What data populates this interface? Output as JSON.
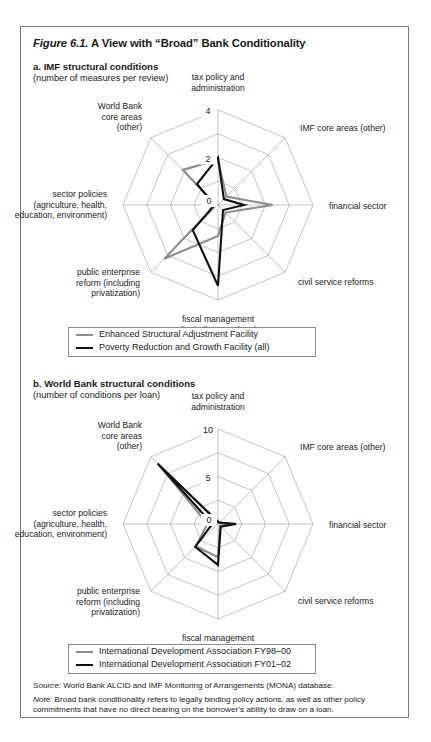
{
  "figure": {
    "title_italic": "Figure 6.1.",
    "title_rest": " A View with “Broad” Bank Conditionality"
  },
  "panel_a": {
    "title": "a. IMF structural conditions",
    "subtitle": "(number of measures per review)",
    "legend": [
      {
        "label": "Enhanced Structural Adjustment Facility",
        "color": "#8c8c8c"
      },
      {
        "label": "Poverty Reduction and Growth Facility (all)",
        "color": "#111111"
      }
    ]
  },
  "panel_b": {
    "title": "b. World Bank structural conditions",
    "subtitle": "(number of conditions per loan)",
    "legend": [
      {
        "label": "International Development Association FY98–00",
        "color": "#8c8c8c"
      },
      {
        "label": "International Development Association FY01–02",
        "color": "#111111"
      }
    ]
  },
  "notes": {
    "source_label": "Source:",
    "source_text": " World Bank ALCID and IMF Monitoring of Arrangements (MONA) database.",
    "note_label": "Note:",
    "note_text": " Broad bank conditionality refers to legally binding policy actions, as well as other policy commitments that have no direct bearing on the  borrower’s ability to draw on a loan."
  },
  "chart_data": [
    {
      "type": "radar",
      "id": "panel-a",
      "title": "a. IMF structural conditions",
      "ylabel": "number of measures per review",
      "categories": [
        "tax policy and administration",
        "IMF core areas (other)",
        "financial sector",
        "civil service reforms",
        "fiscal management (including exp. level and composition)",
        "public enterprise reform (including privatization)",
        "sector policies (agriculture, health, education, environment)",
        "World Bank core areas (other)"
      ],
      "rlim": [
        0,
        4
      ],
      "rticks": [
        0,
        2,
        4
      ],
      "rtick_labels": [
        "0",
        "2",
        "4"
      ],
      "grid": true,
      "legend_position": "below",
      "series": [
        {
          "name": "Enhanced Structural Adjustment Facility",
          "color": "#8c8c8c",
          "values": [
            1.9,
            0.5,
            2.3,
            0.45,
            1.3,
            3.2,
            0.1,
            2.1
          ]
        },
        {
          "name": "Poverty Reduction and Growth Facility (all)",
          "color": "#111111",
          "values": [
            2.0,
            0.35,
            1.1,
            0.3,
            3.4,
            1.5,
            0.15,
            1.25
          ]
        }
      ]
    },
    {
      "type": "radar",
      "id": "panel-b",
      "title": "b. World Bank structural conditions",
      "ylabel": "number of conditions per loan",
      "categories": [
        "tax policy and administration",
        "IMF core areas (other)",
        "financial sector",
        "civil service reforms",
        "fiscal management (including exp. level and composition)",
        "public enterprise reform (including privatization)",
        "sector policies (agriculture, health, education, environment)",
        "World Bank core areas (other)"
      ],
      "rlim": [
        0,
        10
      ],
      "rticks": [
        0,
        5,
        10
      ],
      "rtick_labels": [
        "0",
        "5",
        "10"
      ],
      "grid": true,
      "legend_position": "below",
      "series": [
        {
          "name": "International Development Association FY98–00",
          "color": "#8c8c8c",
          "values": [
            0.2,
            0.2,
            1.5,
            0.3,
            3.5,
            3.3,
            1.1,
            8.6
          ]
        },
        {
          "name": "International Development Association FY01–02",
          "color": "#111111",
          "values": [
            0.25,
            0.2,
            1.9,
            0.4,
            4.3,
            3.4,
            0.6,
            9.0
          ]
        }
      ]
    }
  ]
}
